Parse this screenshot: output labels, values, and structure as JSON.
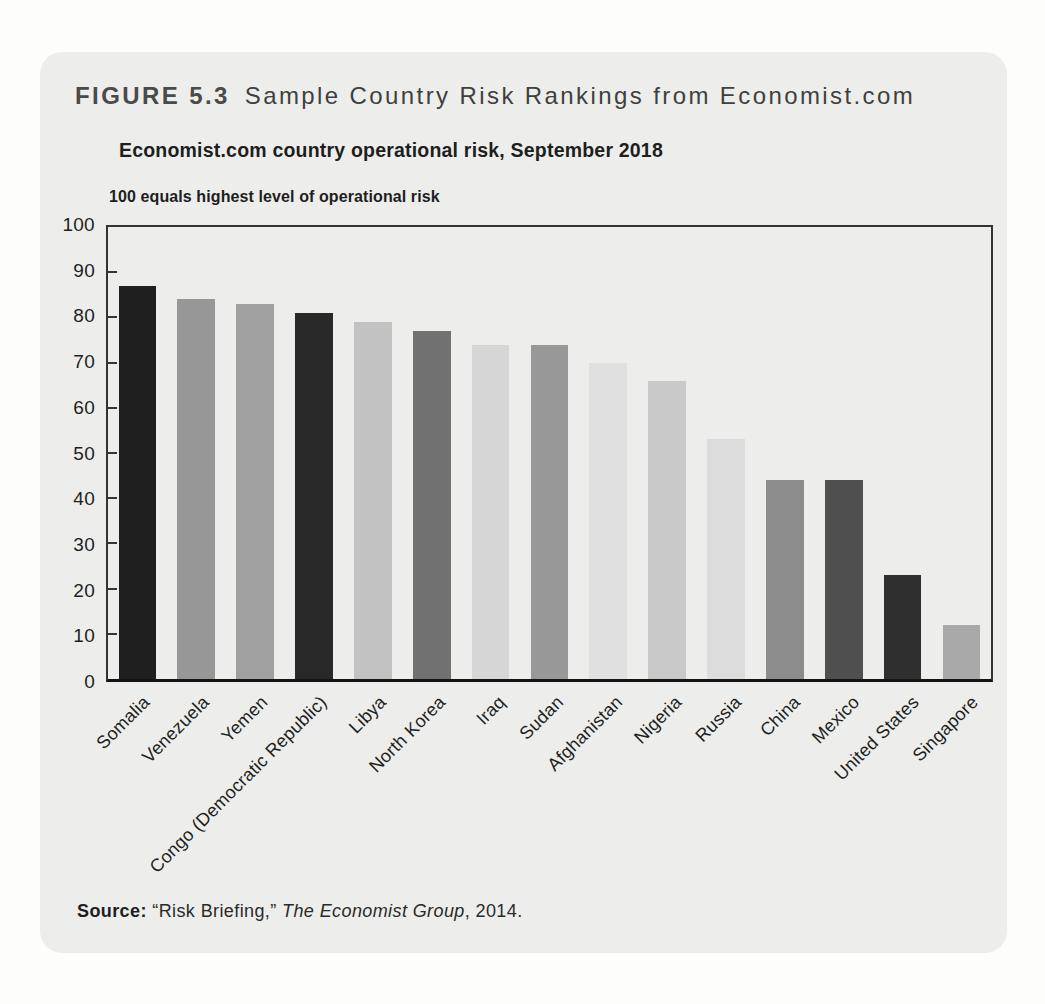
{
  "figure": {
    "number": "FIGURE 5.3",
    "title": "Sample Country Risk Rankings from Economist.com"
  },
  "chart": {
    "heading": "Economist.com country operational risk, September 2018",
    "axis_note": "100 equals highest level of operational risk"
  },
  "source": {
    "label": "Source:",
    "quote": "“Risk Briefing,”",
    "publisher": "The Economist Group",
    "year": ", 2014."
  },
  "colors": {
    "page_bg": "#fdfdfc",
    "panel_bg": "#edeeeb",
    "axis": "#343434",
    "baseline": "#141414",
    "text": "#1f1f1f"
  },
  "chart_data": {
    "type": "bar",
    "title": "Economist.com country operational risk, September 2018",
    "subtitle": "100 equals highest level of operational risk",
    "xlabel": "",
    "ylabel": "",
    "ylim": [
      0,
      100
    ],
    "yticks": [
      0,
      10,
      20,
      30,
      40,
      50,
      60,
      70,
      80,
      90,
      100
    ],
    "grid": false,
    "legend": false,
    "categories": [
      "Somalia",
      "Venezuela",
      "Yemen",
      "Congo (Democratic Republic)",
      "Libya",
      "North Korea",
      "Iraq",
      "Sudan",
      "Afghanistan",
      "Nigeria",
      "Russia",
      "China",
      "Mexico",
      "United States",
      "Singapore"
    ],
    "values": [
      87,
      84,
      83,
      81,
      79,
      77,
      74,
      74,
      70,
      66,
      53,
      44,
      44,
      23,
      12
    ],
    "bar_colors": [
      "#1f1f1f",
      "#979797",
      "#a0a0a0",
      "#282828",
      "#c2c2c2",
      "#717171",
      "#d6d6d6",
      "#989898",
      "#e0e0e0",
      "#c9c9c9",
      "#dcdcdc",
      "#8c8c8c",
      "#4f4f4f",
      "#2f2f2f",
      "#a9a9a9"
    ]
  }
}
